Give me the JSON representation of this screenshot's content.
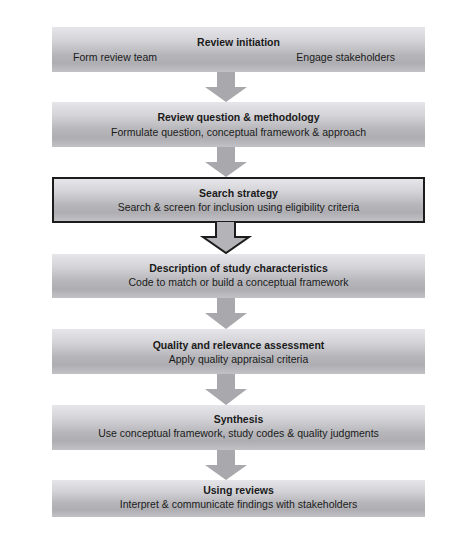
{
  "diagram": {
    "type": "flowchart",
    "direction": "top-to-bottom",
    "colors": {
      "box_gradient_top": "#e6e6ea",
      "box_gradient_mid": "#b6b6ba",
      "arrow_fill": "#a9a9ad",
      "highlight_border": "#1c1c1c",
      "text": "#1a1a1a"
    },
    "steps": [
      {
        "title": "Review initiation",
        "left_item": "Form review team",
        "right_item": "Engage stakeholders"
      },
      {
        "title": "Review question & methodology",
        "subtitle": "Formulate question, conceptual framework & approach"
      },
      {
        "title": "Search strategy",
        "subtitle": "Search & screen for inclusion using eligibility criteria",
        "highlighted": true
      },
      {
        "title": "Description of study characteristics",
        "subtitle": "Code to match or build a conceptual framework"
      },
      {
        "title": "Quality and relevance assessment",
        "subtitle": "Apply quality appraisal criteria"
      },
      {
        "title": "Synthesis",
        "subtitle": "Use conceptual framework, study codes & quality judgments"
      },
      {
        "title": "Using reviews",
        "subtitle": "Interpret & communicate findings with stakeholders"
      }
    ],
    "arrows": [
      {
        "from": 0,
        "to": 1,
        "style": "solid"
      },
      {
        "from": 1,
        "to": 2,
        "style": "solid"
      },
      {
        "from": 2,
        "to": 3,
        "style": "outlined"
      },
      {
        "from": 3,
        "to": 4,
        "style": "solid"
      },
      {
        "from": 4,
        "to": 5,
        "style": "solid"
      },
      {
        "from": 5,
        "to": 6,
        "style": "solid"
      }
    ]
  }
}
